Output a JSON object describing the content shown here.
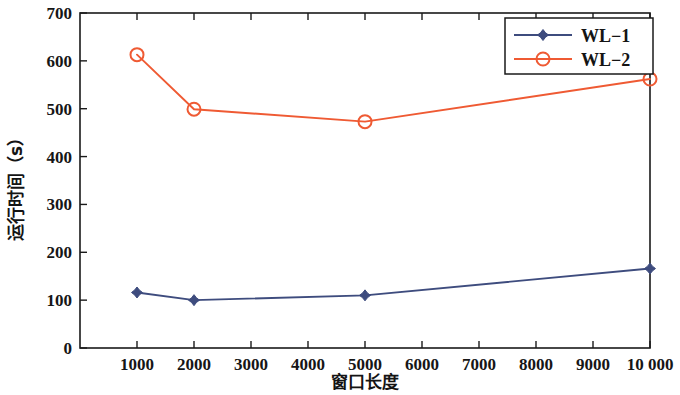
{
  "chart_data": {
    "type": "line",
    "title": "",
    "xlabel": "窗口长度",
    "ylabel": "运行时间（s）",
    "x": [
      1000,
      2000,
      5000,
      10000
    ],
    "xlim": [
      0,
      10000
    ],
    "ylim": [
      0,
      700
    ],
    "grid": false,
    "legend_position": "top-right",
    "x_ticks": [
      "1000",
      "2000",
      "3000",
      "4000",
      "5000",
      "6000",
      "7000",
      "8000",
      "9000",
      "10 000"
    ],
    "x_tick_values": [
      1000,
      2000,
      3000,
      4000,
      5000,
      6000,
      7000,
      8000,
      9000,
      10000
    ],
    "y_ticks": [
      "0",
      "100",
      "200",
      "300",
      "400",
      "500",
      "600",
      "700"
    ],
    "y_tick_values": [
      0,
      100,
      200,
      300,
      400,
      500,
      600,
      700
    ],
    "series": [
      {
        "name": "WL−1",
        "color": "#3e4c7e",
        "marker": "diamond",
        "values": [
          116,
          100,
          110,
          166
        ]
      },
      {
        "name": "WL−2",
        "color": "#ef5a33",
        "marker": "circle",
        "values": [
          613,
          499,
          473,
          562
        ]
      }
    ]
  },
  "legend": {
    "entries": [
      {
        "label": "WL−1"
      },
      {
        "label": "WL−2"
      }
    ]
  },
  "axes": {
    "x_title": "窗口长度",
    "y_title": "运行时间（s）"
  }
}
